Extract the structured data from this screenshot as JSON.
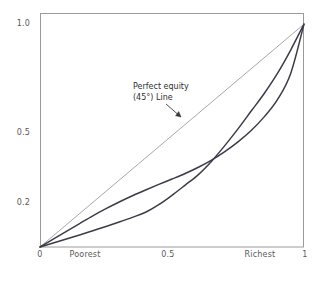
{
  "chart_data": {
    "type": "line",
    "title": "",
    "subtitle": "",
    "xlabel": "",
    "ylabel": "",
    "xlim": [
      0,
      1
    ],
    "ylim": [
      0,
      1.05
    ],
    "grid": false,
    "legend_position": "none",
    "axis": {
      "frame": true,
      "frame_color": "#9a9a9a"
    },
    "x_ticks": [
      {
        "value": 0,
        "label": "0"
      },
      {
        "value": 0.2,
        "label": "Poorest"
      },
      {
        "value": 0.5,
        "label": "0.5"
      },
      {
        "value": 0.82,
        "label": "Richest"
      },
      {
        "value": 1,
        "label": "1"
      }
    ],
    "y_ticks": [
      {
        "value": 0,
        "label": "0"
      },
      {
        "value": 0.2,
        "label": "0.2"
      },
      {
        "value": 0.5,
        "label": "0.5"
      },
      {
        "value": 1.0,
        "label": "1.0"
      }
    ],
    "series": [
      {
        "name": "Perfect equity (45°) Line",
        "color": "#9d9d9d",
        "width": 0.9,
        "x": [
          0,
          1
        ],
        "values": [
          0,
          1
        ]
      },
      {
        "name": "Lorenz curve (concave)",
        "color": "#3c3c49",
        "width": 1.5,
        "x": [
          0,
          0.05,
          0.1,
          0.15,
          0.2,
          0.25,
          0.3,
          0.35,
          0.4,
          0.45,
          0.5,
          0.55,
          0.6,
          0.65,
          0.7,
          0.75,
          0.8,
          0.85,
          0.9,
          0.95,
          1
        ],
        "values": [
          0,
          0.035,
          0.07,
          0.105,
          0.14,
          0.172,
          0.202,
          0.23,
          0.256,
          0.281,
          0.305,
          0.33,
          0.358,
          0.39,
          0.428,
          0.472,
          0.523,
          0.585,
          0.662,
          0.78,
          1
        ]
      },
      {
        "name": "Lorenz curve (S-shaped)",
        "color": "#3c3c49",
        "width": 1.5,
        "x": [
          0,
          0.05,
          0.1,
          0.15,
          0.2,
          0.25,
          0.3,
          0.35,
          0.4,
          0.45,
          0.5,
          0.55,
          0.6,
          0.65,
          0.7,
          0.75,
          0.8,
          0.85,
          0.9,
          0.95,
          1
        ],
        "values": [
          0,
          0.018,
          0.036,
          0.054,
          0.073,
          0.092,
          0.112,
          0.133,
          0.156,
          0.19,
          0.232,
          0.278,
          0.325,
          0.385,
          0.455,
          0.53,
          0.61,
          0.69,
          0.78,
          0.885,
          1
        ]
      }
    ],
    "annotations": [
      {
        "name": "perfect-equity-label",
        "line1": "Perfect equity",
        "line2": "(45°) Line",
        "arrow_from": {
          "x": 0.48,
          "y": 0.63
        },
        "arrow_to": {
          "x": 0.545,
          "y": 0.56
        }
      }
    ]
  },
  "labels": {
    "y": {
      "one": "1.0",
      "half": "0.5",
      "fifth": "0.2",
      "zero": "0"
    },
    "x": {
      "zero": "0",
      "poorest": "Poorest",
      "half": "0.5",
      "richest": "Richest",
      "one": "1"
    },
    "annotation": {
      "line1": "Perfect equity",
      "line2": "(45°) Line"
    }
  },
  "colors": {
    "frame": "#9a9a9a",
    "equity_line": "#9d9d9d",
    "lorenz_curve": "#3c3c49",
    "text": "#4a4a4a",
    "background": "#ffffff"
  }
}
